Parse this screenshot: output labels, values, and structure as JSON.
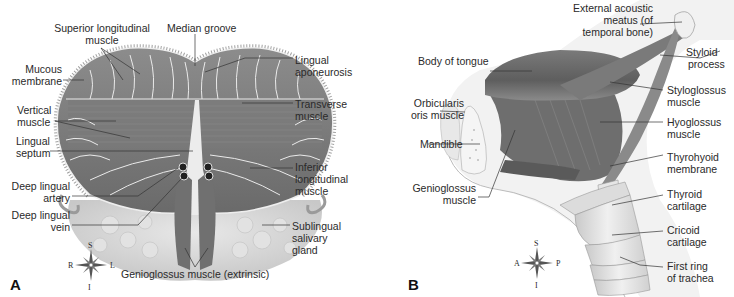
{
  "panel_a": {
    "letter": "A",
    "labels": {
      "superior_longitudinal": [
        "Superior longitudinal",
        "muscle"
      ],
      "median_groove": "Median groove",
      "mucous_membrane": [
        "Mucous",
        "membrane"
      ],
      "lingual_aponeurosis": [
        "Lingual",
        "aponeurosis"
      ],
      "vertical_muscle": [
        "Vertical",
        "muscle"
      ],
      "transverse_muscle": [
        "Transverse",
        "muscle"
      ],
      "lingual_septum": [
        "Lingual",
        "septum"
      ],
      "inferior_longitudinal": [
        "Inferior",
        "longitudinal",
        "muscle"
      ],
      "deep_lingual_artery": [
        "Deep lingual",
        "artery"
      ],
      "deep_lingual_vein": [
        "Deep lingual",
        "vein"
      ],
      "sublingual_gland": [
        "Sublingual",
        "salivary",
        "gland"
      ],
      "genioglossus": "Genioglossus muscle (extrinsic)"
    },
    "compass": {
      "top": "S",
      "bottom": "I",
      "left": "R",
      "right": "L"
    }
  },
  "panel_b": {
    "letter": "B",
    "labels": {
      "external_acoustic": [
        "External acoustic",
        "meatus (of",
        "temporal bone)"
      ],
      "body_of_tongue": "Body of tongue",
      "styloid_process": [
        "Styloid",
        "process"
      ],
      "orbicularis": [
        "Orbicularis",
        "oris muscle"
      ],
      "styloglossus": [
        "Styloglossus",
        "muscle"
      ],
      "hyoglossus": [
        "Hyoglossus",
        "muscle"
      ],
      "mandible": "Mandible",
      "thyrohyoid": [
        "Thyrohyoid",
        "membrane"
      ],
      "genioglossus": [
        "Genioglossus",
        "muscle"
      ],
      "thyroid_cartilage": [
        "Thyroid",
        "cartilage"
      ],
      "cricoid_cartilage": [
        "Cricoid",
        "cartilage"
      ],
      "first_ring": [
        "First ring",
        "of trachea"
      ]
    },
    "compass": {
      "top": "S",
      "bottom": "I",
      "left": "A",
      "right": "P"
    }
  },
  "colors": {
    "muscle_dark": "#6e6e6e",
    "muscle_mid": "#8a8a8a",
    "tissue_light": "#d9d9d9",
    "leader_line": "#333333"
  }
}
